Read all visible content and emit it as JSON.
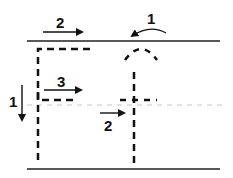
{
  "diagram": {
    "colors": {
      "ink": "#111111",
      "guide": "#c8c8c8",
      "background": "#ffffff"
    },
    "labels": {
      "top_arrow": "2",
      "curved_arrow": "1",
      "middle_arrow": "3",
      "left_down_arrow": "1",
      "small_arrow": "2"
    }
  }
}
